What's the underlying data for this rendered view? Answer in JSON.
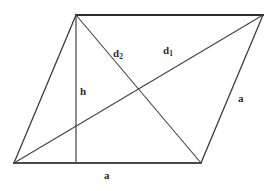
{
  "figure": {
    "kind": "parallelogram-geometry-diagram",
    "background_color": "#ffffff",
    "line_color": "#3a3a3a",
    "label_color": "#2b2b2b",
    "vertices": {
      "top_left": {
        "x": 76,
        "y": 15
      },
      "top_right": {
        "x": 263,
        "y": 15
      },
      "bottom_right": {
        "x": 201,
        "y": 163
      },
      "bottom_left": {
        "x": 14,
        "y": 163
      }
    },
    "height_foot": {
      "x": 76,
      "y": 163
    },
    "diagonal_intersection": {
      "x": 138,
      "y": 90
    },
    "labels": {
      "diagonal_2": {
        "text": "d",
        "sub": "2"
      },
      "diagonal_1": {
        "text": "d",
        "sub": "1"
      },
      "height": {
        "text": "h"
      },
      "side_right": {
        "text": "a"
      },
      "side_bottom": {
        "text": "a"
      }
    }
  }
}
